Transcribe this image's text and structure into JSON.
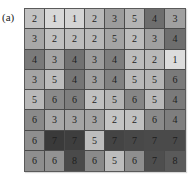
{
  "label": "(a)",
  "grid": {
    "rows": 8,
    "cols": 8,
    "cells": [
      [
        {
          "v": "2",
          "c": "#c2c2c2"
        },
        {
          "v": "1",
          "c": "#d8d8d8"
        },
        {
          "v": "1",
          "c": "#d4d4d4"
        },
        {
          "v": "2",
          "c": "#b8b8b8"
        },
        {
          "v": "3",
          "c": "#9c9c9c"
        },
        {
          "v": "5",
          "c": "#b4b4b4"
        },
        {
          "v": "4",
          "c": "#6e6e6e"
        },
        {
          "v": "3",
          "c": "#a0a0a0"
        }
      ],
      [
        {
          "v": "3",
          "c": "#a8a8a8"
        },
        {
          "v": "2",
          "c": "#c0c0c0"
        },
        {
          "v": "2",
          "c": "#bcbcbc"
        },
        {
          "v": "2",
          "c": "#b8b8b8"
        },
        {
          "v": "5",
          "c": "#a4a4a4"
        },
        {
          "v": "2",
          "c": "#bcbcbc"
        },
        {
          "v": "3",
          "c": "#a0a0a0"
        },
        {
          "v": "4",
          "c": "#6e6e6e"
        }
      ],
      [
        {
          "v": "4",
          "c": "#7a7a7a"
        },
        {
          "v": "3",
          "c": "#a4a4a4"
        },
        {
          "v": "4",
          "c": "#727272"
        },
        {
          "v": "3",
          "c": "#9c9c9c"
        },
        {
          "v": "4",
          "c": "#7e7e7e"
        },
        {
          "v": "2",
          "c": "#bcbcbc"
        },
        {
          "v": "2",
          "c": "#b8b8b8"
        },
        {
          "v": "1",
          "c": "#dcdcdc"
        }
      ],
      [
        {
          "v": "3",
          "c": "#a4a4a4"
        },
        {
          "v": "5",
          "c": "#bcbcbc"
        },
        {
          "v": "4",
          "c": "#767676"
        },
        {
          "v": "3",
          "c": "#a0a0a0"
        },
        {
          "v": "4",
          "c": "#828282"
        },
        {
          "v": "5",
          "c": "#b8b8b8"
        },
        {
          "v": "5",
          "c": "#b4b4b4"
        },
        {
          "v": "6",
          "c": "#7a7a7a"
        }
      ],
      [
        {
          "v": "5",
          "c": "#b8b8b8"
        },
        {
          "v": "6",
          "c": "#8a8a8a"
        },
        {
          "v": "6",
          "c": "#7e7e7e"
        },
        {
          "v": "2",
          "c": "#c0c0c0"
        },
        {
          "v": "5",
          "c": "#b4b4b4"
        },
        {
          "v": "6",
          "c": "#868686"
        },
        {
          "v": "5",
          "c": "#b8b8b8"
        },
        {
          "v": "4",
          "c": "#7a7a7a"
        }
      ],
      [
        {
          "v": "6",
          "c": "#8a8a8a"
        },
        {
          "v": "3",
          "c": "#a8a8a8"
        },
        {
          "v": "3",
          "c": "#a4a4a4"
        },
        {
          "v": "3",
          "c": "#a4a4a4"
        },
        {
          "v": "2",
          "c": "#c4c4c4"
        },
        {
          "v": "2",
          "c": "#c0c0c0"
        },
        {
          "v": "6",
          "c": "#8a8a8a"
        },
        {
          "v": "4",
          "c": "#7e7e7e"
        }
      ],
      [
        {
          "v": "6",
          "c": "#8e8e8e"
        },
        {
          "v": "7",
          "c": "#3a3a3a"
        },
        {
          "v": "7",
          "c": "#3e3e3e"
        },
        {
          "v": "5",
          "c": "#bcbcbc"
        },
        {
          "v": "7",
          "c": "#444444"
        },
        {
          "v": "7",
          "c": "#484848"
        },
        {
          "v": "7",
          "c": "#4a4a4a"
        },
        {
          "v": "7",
          "c": "#4a4a4a"
        }
      ],
      [
        {
          "v": "6",
          "c": "#8e8e8e"
        },
        {
          "v": "6",
          "c": "#929292"
        },
        {
          "v": "8",
          "c": "#4a4a4a"
        },
        {
          "v": "6",
          "c": "#8a8a8a"
        },
        {
          "v": "5",
          "c": "#bcbcbc"
        },
        {
          "v": "6",
          "c": "#8e8e8e"
        },
        {
          "v": "7",
          "c": "#4e4e4e"
        },
        {
          "v": "8",
          "c": "#5a5a5a"
        }
      ]
    ]
  }
}
